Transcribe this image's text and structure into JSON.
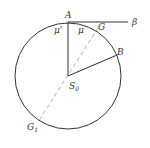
{
  "diagram": {
    "type": "geometry",
    "circle": {
      "cx": 68,
      "cy": 76,
      "r": 53
    },
    "colors": {
      "stroke": "#333333",
      "dashed": "#999999",
      "text": "#333333"
    },
    "labels": {
      "A": "A",
      "beta": "β",
      "mu_prime": "μ'",
      "mu": "μ",
      "G": "G",
      "B": "B",
      "S0": "S",
      "S0_sub": "0",
      "G1": "G",
      "G1_sub": "1"
    }
  }
}
